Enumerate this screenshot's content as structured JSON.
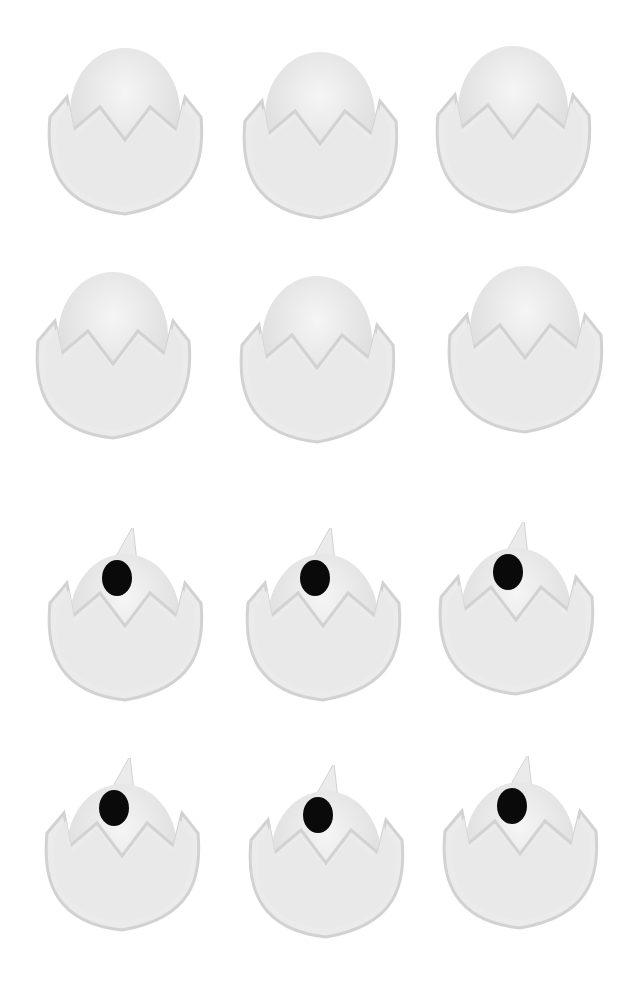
{
  "image": {
    "description": "Twelve white felt hatching-egg figures arranged in a 3x4 grid; top two rows show plain eggs in cracked shells, bottom two rows show eggs with a black eye and a small beak/horn on top",
    "colors": {
      "background": "#ffffff",
      "felt": "#ebebeb",
      "felt_shadow": "#d2d2d2",
      "eye": "#0a0a0a"
    }
  },
  "eggs": [
    {
      "row": 1,
      "col": 1,
      "x": 45,
      "y": 42,
      "eye": false
    },
    {
      "row": 1,
      "col": 2,
      "x": 240,
      "y": 46,
      "eye": false
    },
    {
      "row": 1,
      "col": 3,
      "x": 433,
      "y": 40,
      "eye": false
    },
    {
      "row": 2,
      "col": 1,
      "x": 33,
      "y": 266,
      "eye": false
    },
    {
      "row": 2,
      "col": 2,
      "x": 237,
      "y": 270,
      "eye": false
    },
    {
      "row": 2,
      "col": 3,
      "x": 445,
      "y": 260,
      "eye": false
    },
    {
      "row": 3,
      "col": 1,
      "x": 45,
      "y": 528,
      "eye": true
    },
    {
      "row": 3,
      "col": 2,
      "x": 243,
      "y": 528,
      "eye": true
    },
    {
      "row": 3,
      "col": 3,
      "x": 436,
      "y": 522,
      "eye": true
    },
    {
      "row": 4,
      "col": 1,
      "x": 42,
      "y": 758,
      "eye": true
    },
    {
      "row": 4,
      "col": 2,
      "x": 246,
      "y": 765,
      "eye": true
    },
    {
      "row": 4,
      "col": 3,
      "x": 440,
      "y": 756,
      "eye": true
    }
  ]
}
